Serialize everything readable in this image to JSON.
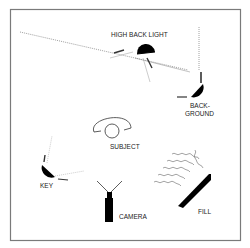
{
  "diagram": {
    "labels": {
      "high_back_light": "HIGH BACK LIGHT",
      "background_line1": "BACK-",
      "background_line2": "GROUND",
      "subject": "SUBJECT",
      "key": "KEY",
      "camera": "CAMERA",
      "fill": "FILL"
    },
    "colors": {
      "stroke": "#222222",
      "border": "#7a7a7a",
      "dotted": "#888888",
      "fill": "#000000"
    }
  }
}
